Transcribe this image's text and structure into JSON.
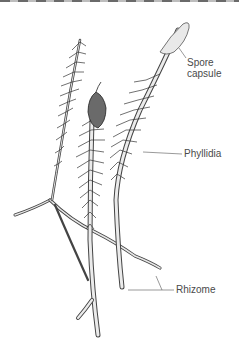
{
  "figure": {
    "labels": {
      "spore_capsule_line1": "Spore",
      "spore_capsule_line2": "capsule",
      "phyllidia": "Phyllidia",
      "rhizome": "Rhizome"
    }
  },
  "colors": {
    "background": "#ffffff",
    "label_text": "#4a4a4a",
    "plant_stroke": "#3a3a3a",
    "plant_fill": "#e6e6e6"
  }
}
